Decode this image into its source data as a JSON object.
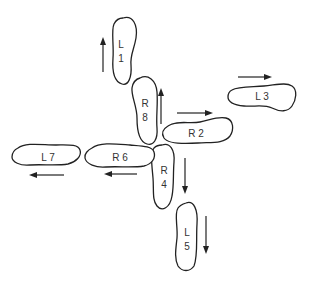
{
  "diagram": {
    "colors": {
      "stroke": "#222222",
      "text": "#333333",
      "background": "#ffffff"
    },
    "segments": [
      {
        "id": "L1",
        "line1": "L",
        "line2": "1",
        "arrow": "up"
      },
      {
        "id": "R8",
        "line1": "R",
        "line2": "8",
        "arrow": "up"
      },
      {
        "id": "R2",
        "line1": "R 2",
        "arrow": "right"
      },
      {
        "id": "L3",
        "line1": "L 3",
        "arrow": "right"
      },
      {
        "id": "R4",
        "line1": "R",
        "line2": "4",
        "arrow": "down"
      },
      {
        "id": "L5",
        "line1": "L",
        "line2": "5",
        "arrow": "down"
      },
      {
        "id": "R6",
        "line1": "R 6",
        "arrow": "left"
      },
      {
        "id": "L7",
        "line1": "L 7",
        "arrow": "left"
      }
    ]
  }
}
